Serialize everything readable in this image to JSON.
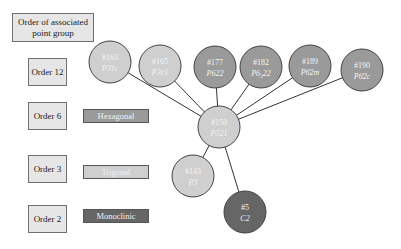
{
  "legend": {
    "header": "Order of associated point group",
    "orders": [
      "Order 12",
      "Order 6",
      "Order 3",
      "Order 2"
    ]
  },
  "crystal_systems": [
    {
      "label": "Hexagonal",
      "color": "#9a9a9a"
    },
    {
      "label": "Trigonal",
      "color": "#cfcfcf"
    },
    {
      "label": "Monoclinic",
      "color": "#666666"
    }
  ],
  "nodes": [
    {
      "id": "n163",
      "number": "#163",
      "symbol": "P3̄1c",
      "color": "#cfcfcf"
    },
    {
      "id": "n165",
      "number": "#165",
      "symbol": "P3̄c1",
      "color": "#cfcfcf"
    },
    {
      "id": "n177",
      "number": "#177",
      "symbol": "P622",
      "color": "#9a9a9a"
    },
    {
      "id": "n182",
      "number": "#182",
      "symbol": "P6₃22",
      "color": "#9a9a9a"
    },
    {
      "id": "n189",
      "number": "#189",
      "symbol": "P6̄2m",
      "color": "#9a9a9a"
    },
    {
      "id": "n190",
      "number": "#190",
      "symbol": "P6̄2c",
      "color": "#9a9a9a"
    },
    {
      "id": "n150",
      "number": "#150",
      "symbol": "P321",
      "color": "#cfcfcf"
    },
    {
      "id": "n143",
      "number": "#143",
      "symbol": "P3",
      "color": "#cfcfcf"
    },
    {
      "id": "n5",
      "number": "#5",
      "symbol": "C2",
      "color": "#666666"
    }
  ],
  "edges": [
    [
      "n150",
      "n163"
    ],
    [
      "n150",
      "n165"
    ],
    [
      "n150",
      "n177"
    ],
    [
      "n150",
      "n182"
    ],
    [
      "n150",
      "n189"
    ],
    [
      "n150",
      "n190"
    ],
    [
      "n150",
      "n143"
    ],
    [
      "n150",
      "n5"
    ]
  ]
}
